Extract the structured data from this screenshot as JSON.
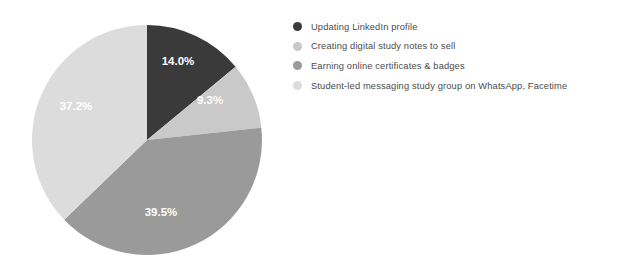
{
  "chart_data": {
    "type": "pie",
    "title": "",
    "labels": [
      "Updating LinkedIn profile",
      "Creating digital study notes to sell",
      "Earning online certificates & badges",
      "Student-led messaging study group on WhatsApp, Facetime"
    ],
    "values": [
      14.0,
      9.3,
      39.5,
      37.2
    ],
    "value_labels": [
      "14.0%",
      "9.3%",
      "39.5%",
      "37.2%"
    ],
    "colors": [
      "#3a3a3a",
      "#c9c9c9",
      "#9a9a9a",
      "#dcdcdc"
    ],
    "units": "percent",
    "start_angle_deg": 0,
    "direction": "clockwise",
    "legend_position": "right",
    "grid": false
  },
  "legend": {
    "items": [
      {
        "label": "Updating LinkedIn profile",
        "color": "#3a3a3a",
        "value_label": "14.0%"
      },
      {
        "label": "Creating digital study notes to sell",
        "color": "#c9c9c9",
        "value_label": "9.3%"
      },
      {
        "label": "Earning online certificates & badges",
        "color": "#9a9a9a",
        "value_label": "39.5%"
      },
      {
        "label": "Student-led messaging study group on WhatsApp, Facetime",
        "color": "#dcdcdc",
        "value_label": "37.2%"
      }
    ]
  },
  "slices": [
    {
      "value_label": "14.0%",
      "label_x": 178,
      "label_y": 62,
      "text_class": "on-dark"
    },
    {
      "value_label": "9.3%",
      "label_x": 210,
      "label_y": 101,
      "text_class": "on-light"
    },
    {
      "value_label": "39.5%",
      "label_x": 161,
      "label_y": 213,
      "text_class": "on-light"
    },
    {
      "value_label": "37.2%",
      "label_x": 76,
      "label_y": 107,
      "text_class": "on-light"
    }
  ]
}
